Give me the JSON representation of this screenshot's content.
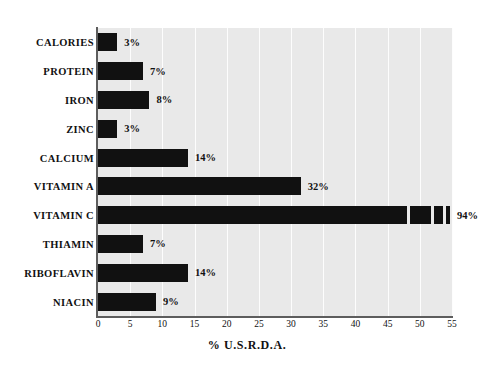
{
  "chart_data": {
    "type": "bar",
    "orientation": "horizontal",
    "title": "",
    "xlabel": "% U.S.R.D.A.",
    "ylabel": "",
    "xlim": [
      0,
      55
    ],
    "xticks": [
      0,
      5,
      10,
      15,
      20,
      25,
      30,
      35,
      40,
      45,
      50,
      55
    ],
    "grid": true,
    "grid_axis": "x",
    "legend": "none",
    "categories": [
      "CALORIES",
      "PROTEIN",
      "IRON",
      "ZINC",
      "CALCIUM",
      "VITAMIN A",
      "VITAMIN C",
      "THIAMIN",
      "RIBOFLAVIN",
      "NIACIN"
    ],
    "values": [
      3,
      7,
      8,
      3,
      14,
      32,
      94,
      7,
      14,
      9
    ],
    "value_labels": [
      "3%",
      "7%",
      "8%",
      "3%",
      "14%",
      "32%",
      "94%",
      "7%",
      "14%",
      "9%"
    ],
    "bars": [
      {
        "label": "CALORIES",
        "value": 3,
        "value_label": "3%",
        "drawn_to": 3,
        "truncated": false
      },
      {
        "label": "PROTEIN",
        "value": 7,
        "value_label": "7%",
        "drawn_to": 7,
        "truncated": false
      },
      {
        "label": "IRON",
        "value": 8,
        "value_label": "8%",
        "drawn_to": 8,
        "truncated": false
      },
      {
        "label": "ZINC",
        "value": 3,
        "value_label": "3%",
        "drawn_to": 3,
        "truncated": false
      },
      {
        "label": "CALCIUM",
        "value": 14,
        "value_label": "14%",
        "drawn_to": 14,
        "truncated": false
      },
      {
        "label": "VITAMIN A",
        "value": 32,
        "value_label": "32%",
        "drawn_to": 31.5,
        "truncated": false
      },
      {
        "label": "VITAMIN C",
        "value": 94,
        "value_label": "94%",
        "drawn_to": 54,
        "truncated": true
      },
      {
        "label": "THIAMIN",
        "value": 7,
        "value_label": "7%",
        "drawn_to": 7,
        "truncated": false
      },
      {
        "label": "RIBOFLAVIN",
        "value": 14,
        "value_label": "14%",
        "drawn_to": 14,
        "truncated": false
      },
      {
        "label": "NIACIN",
        "value": 9,
        "value_label": "9%",
        "drawn_to": 9,
        "truncated": false
      }
    ],
    "colors": {
      "bar": "#111111",
      "plot_background": "#e9e9e9",
      "page_background": "#ffffff",
      "gridline": "#fdfdfd",
      "axis": "#5d5d5d",
      "text": "#111111"
    }
  }
}
